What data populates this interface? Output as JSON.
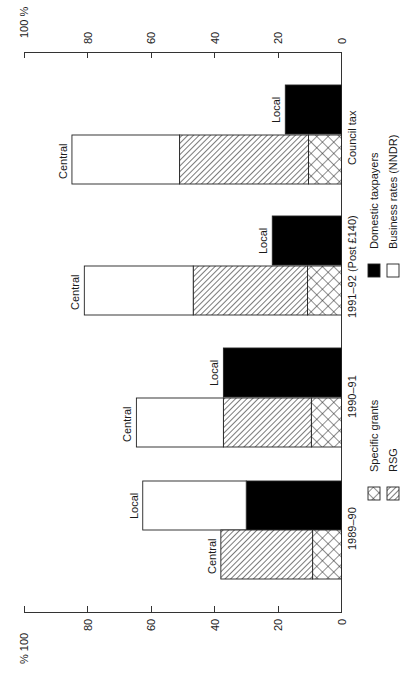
{
  "chart_data": {
    "type": "bar",
    "orientation": "horizontal-stacked (figure rotated 90°)",
    "title": "",
    "axis": {
      "label": "%",
      "range": [
        0,
        100
      ],
      "ticks": [
        "0",
        "20",
        "40",
        "60",
        "80",
        "100"
      ],
      "top_label": "100  %",
      "bottom_label": "% 100"
    },
    "categories": [
      "1989–90",
      "1990–91",
      "1991–92 (Post £140)",
      "Council tax"
    ],
    "groups": [
      {
        "category": "1989–90",
        "bars": [
          {
            "label": "Local",
            "segments": [
              {
                "series": "Domestic taxpayers",
                "from": 0,
                "to": 30
              },
              {
                "series": "Business rates (NNDR)",
                "from": 30,
                "to": 62.6
              }
            ]
          },
          {
            "label": "Central",
            "segments": [
              {
                "series": "Specific grants",
                "from": 0,
                "to": 9.1
              },
              {
                "series": "RSG",
                "from": 9.1,
                "to": 38
              }
            ]
          }
        ]
      },
      {
        "category": "1990–91",
        "bars": [
          {
            "label": "Local",
            "segments": [
              {
                "series": "Domestic taxpayers",
                "from": 0,
                "to": 37.2
              }
            ]
          },
          {
            "label": "Central",
            "segments": [
              {
                "series": "Specific grants",
                "from": 0,
                "to": 9.5
              },
              {
                "series": "RSG",
                "from": 9.5,
                "to": 37.2
              },
              {
                "series": "Business rates (NNDR)",
                "from": 37.2,
                "to": 64.6
              }
            ]
          }
        ]
      },
      {
        "category": "1991–92 (Post £140)",
        "bars": [
          {
            "label": "Local",
            "segments": [
              {
                "series": "Domestic taxpayers",
                "from": 0,
                "to": 21.8
              }
            ]
          },
          {
            "label": "Central",
            "segments": [
              {
                "series": "Specific grants",
                "from": 0,
                "to": 10.7
              },
              {
                "series": "RSG",
                "from": 10.7,
                "to": 46.7
              },
              {
                "series": "Business rates (NNDR)",
                "from": 46.7,
                "to": 81
              }
            ]
          }
        ]
      },
      {
        "category": "Council tax",
        "bars": [
          {
            "label": "Local",
            "segments": [
              {
                "series": "Domestic taxpayers",
                "from": 0,
                "to": 17.7
              }
            ]
          },
          {
            "label": "Central",
            "segments": [
              {
                "series": "Specific grants",
                "from": 0,
                "to": 10.4
              },
              {
                "series": "RSG",
                "from": 10.4,
                "to": 51
              },
              {
                "series": "Business rates (NNDR)",
                "from": 51,
                "to": 84.9
              }
            ]
          }
        ]
      }
    ],
    "legend": [
      {
        "label": "Specific grants",
        "pattern": "cross-hatch"
      },
      {
        "label": "RSG",
        "pattern": "diagonal-hatch"
      },
      {
        "label": "Domestic taxpayers",
        "pattern": "solid-black"
      },
      {
        "label": "Business rates (NNDR)",
        "pattern": "white"
      }
    ],
    "legend_position": "right (bottom after rotation)",
    "grid": false
  },
  "labels": {
    "local": "Local",
    "central": "Central"
  }
}
